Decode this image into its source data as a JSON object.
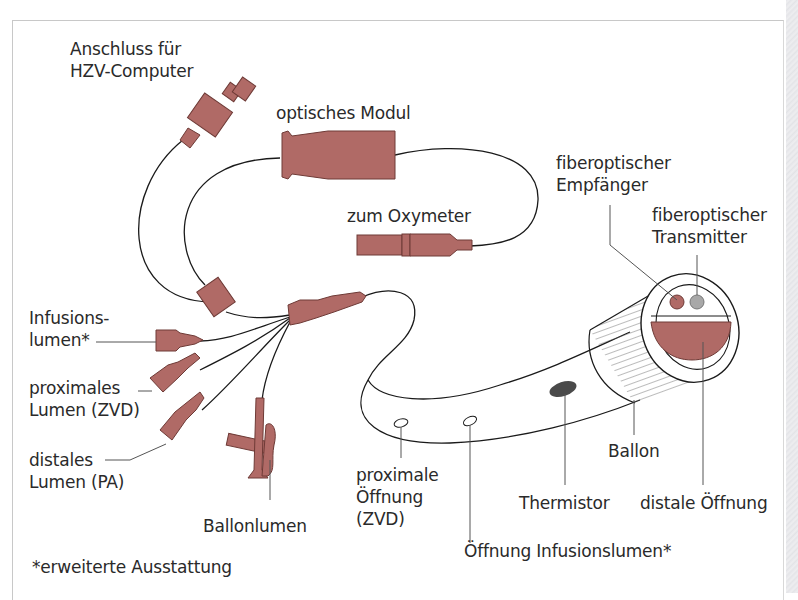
{
  "diagram": {
    "colors": {
      "component_fill": "#b06a66",
      "component_stroke": "#6e3a36",
      "line": "#1a1a1a",
      "leader_line": "#555555",
      "thermistor": "#4a4a4a",
      "transmitter": "#a8a8a8",
      "frame": "#c8c8c8",
      "text": "#2a2a2a"
    },
    "labels": {
      "hzv_connector": {
        "line1": "Anschluss für",
        "line2": "HZV-Computer"
      },
      "optical_module": {
        "line1": "optisches Modul"
      },
      "oxymeter": {
        "line1": "zum Oxymeter"
      },
      "fiber_receiver": {
        "line1": "fiberoptischer",
        "line2": "Empfänger"
      },
      "fiber_transmitter": {
        "line1": "fiberoptischer",
        "line2": "Transmitter"
      },
      "infusion_lumen": {
        "line1": "Infusions-",
        "line2": "lumen*"
      },
      "proximal_lumen": {
        "line1": "proximales",
        "line2": "Lumen (ZVD)"
      },
      "distal_lumen": {
        "line1": "distales",
        "line2": "Lumen (PA)"
      },
      "balloon_lumen": {
        "line1": "Ballonlumen"
      },
      "proximal_opening": {
        "line1": "proximale",
        "line2": "Öffnung",
        "line3": "(ZVD)"
      },
      "infusion_opening": {
        "line1": "Öffnung Infusionslumen*"
      },
      "thermistor": {
        "line1": "Thermistor"
      },
      "balloon": {
        "line1": "Ballon"
      },
      "distal_opening": {
        "line1": "distale Öffnung"
      },
      "footnote": {
        "line1": "*erweiterte Ausstattung"
      }
    }
  }
}
